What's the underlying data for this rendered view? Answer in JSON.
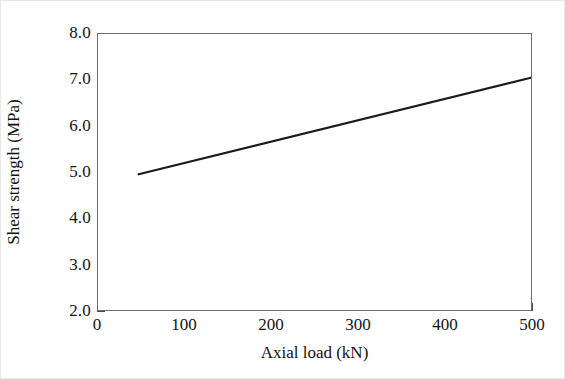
{
  "chart_data": {
    "type": "line",
    "title": "",
    "xlabel": "Axial load (kN)",
    "ylabel": "Shear strength (MPa)",
    "xlim": [
      0,
      500
    ],
    "ylim": [
      2.0,
      8.0
    ],
    "xticks": [
      0,
      100,
      200,
      300,
      400,
      500
    ],
    "xtick_labels": [
      "0",
      "100",
      "200",
      "300",
      "400",
      "500"
    ],
    "yticks": [
      2.0,
      3.0,
      4.0,
      5.0,
      6.0,
      7.0,
      8.0
    ],
    "ytick_labels": [
      "2.0",
      "3.0",
      "4.0",
      "5.0",
      "6.0",
      "7.0",
      "8.0"
    ],
    "grid": false,
    "legend": false,
    "legend_position": "none",
    "series": [
      {
        "name": "shear-strength-vs-axial-load",
        "color": "#1a1a1a",
        "line_width": 2.2,
        "x": [
          47,
          500
        ],
        "y": [
          4.95,
          7.05
        ],
        "points": [
          {
            "x": 47,
            "y": 4.95
          },
          {
            "x": 100,
            "y": 5.19
          },
          {
            "x": 200,
            "y": 5.66
          },
          {
            "x": 300,
            "y": 6.12
          },
          {
            "x": 400,
            "y": 6.59
          },
          {
            "x": 500,
            "y": 7.05
          }
        ]
      }
    ]
  },
  "style": {
    "background": "#ffffff",
    "frame_color": "#6e6e6e",
    "tick_color": "#4a4a4a",
    "text_color": "#141414",
    "line_color": "#1a1a1a"
  }
}
